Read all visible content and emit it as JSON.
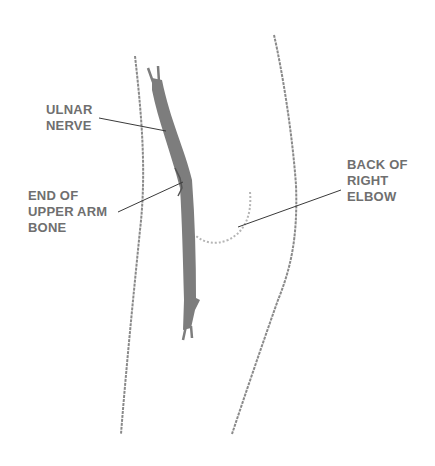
{
  "diagram": {
    "labels": {
      "ulnar_nerve": [
        "ULNAR",
        "NERVE"
      ],
      "upper_arm_bone": [
        "END OF",
        "UPPER ARM",
        "BONE"
      ],
      "back_of_elbow": [
        "BACK OF",
        "RIGHT",
        "ELBOW"
      ]
    },
    "colors": {
      "nerve": "#7d7d7d",
      "outline": "#8a8a8a",
      "leader_line": "#3a3a3a",
      "label_text": "#6f6f6f"
    }
  }
}
